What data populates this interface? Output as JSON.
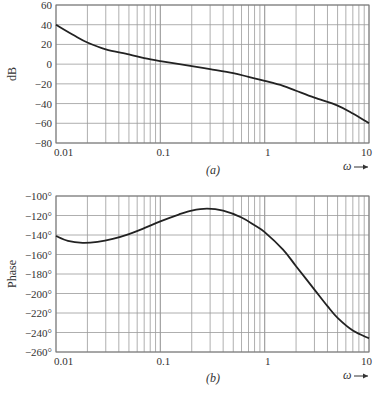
{
  "chart_data": [
    {
      "type": "line",
      "title": "",
      "caption": "(a)",
      "xscale": "log",
      "xlabel": "ω",
      "ylabel": "dB",
      "xlim": [
        0.01,
        10
      ],
      "ylim": [
        -80,
        60
      ],
      "grid": true,
      "x_tick_labels": [
        "0.01",
        "0.1",
        "1",
        "10"
      ],
      "y_tick_labels": [
        "60",
        "40",
        "20",
        "0",
        "-20",
        "-40",
        "-60",
        "-80"
      ],
      "y_ticks": [
        60,
        40,
        20,
        0,
        -20,
        -40,
        -60,
        -80
      ],
      "series": [
        {
          "name": "magnitude",
          "x": [
            0.01,
            0.015,
            0.02,
            0.03,
            0.05,
            0.07,
            0.1,
            0.2,
            0.3,
            0.5,
            0.7,
            1,
            1.5,
            2,
            3,
            5,
            7,
            10
          ],
          "values": [
            40,
            29,
            22,
            15,
            10,
            6,
            3,
            -2,
            -5,
            -9,
            -13,
            -17,
            -22,
            -27,
            -34,
            -42,
            -50,
            -60
          ]
        }
      ]
    },
    {
      "type": "line",
      "title": "",
      "caption": "(b)",
      "xscale": "log",
      "xlabel": "ω",
      "ylabel": "Phase",
      "xlim": [
        0.01,
        10
      ],
      "ylim": [
        -260,
        -100
      ],
      "grid": true,
      "x_tick_labels": [
        "0.01",
        "0.1",
        "1",
        "10"
      ],
      "y_tick_labels": [
        "-100°",
        "-120°",
        "-140°",
        "-160°",
        "-180°",
        "-200°",
        "-220°",
        "-240°",
        "-260°"
      ],
      "y_ticks": [
        -100,
        -120,
        -140,
        -160,
        -180,
        -200,
        -220,
        -240,
        -260
      ],
      "series": [
        {
          "name": "phase",
          "x": [
            0.01,
            0.013,
            0.018,
            0.025,
            0.035,
            0.05,
            0.07,
            0.1,
            0.15,
            0.2,
            0.28,
            0.4,
            0.6,
            0.8,
            1,
            1.5,
            2,
            3,
            4,
            5,
            7,
            10
          ],
          "values": [
            -141,
            -146,
            -148,
            -147,
            -144,
            -139,
            -133,
            -126,
            -119,
            -115,
            -113,
            -115,
            -122,
            -130,
            -137,
            -155,
            -172,
            -196,
            -213,
            -225,
            -238,
            -246
          ]
        }
      ]
    }
  ],
  "labels": {
    "top_ylabel": "dB",
    "bottom_ylabel": "Phase",
    "omega": "ω",
    "caption_a": "(a)",
    "caption_b": "(b)"
  }
}
